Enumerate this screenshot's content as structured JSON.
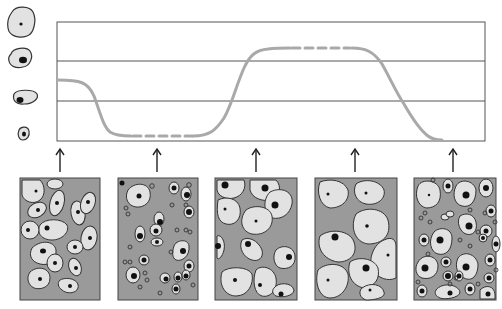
{
  "diagram": {
    "type": "cell-cycle-stage-graph",
    "colors": {
      "background": "#ffffff",
      "frame": "#555555",
      "curve": "#a9a9a9",
      "panel_bg": "#9a9a9a",
      "cell_fill": "#e2e2e2",
      "cell_outline": "#333333",
      "nucleus": "#111111"
    },
    "legend_cells": [
      {
        "id": "large-cell-small-nucleus",
        "size": "large"
      },
      {
        "id": "medium-cell-medium-nucleus",
        "size": "medium"
      },
      {
        "id": "small-oval-cell",
        "size": "small"
      },
      {
        "id": "tiny-cell-large-nucleus",
        "size": "tiny"
      }
    ],
    "graph": {
      "box": {
        "x": 57,
        "y": 22,
        "w": 428,
        "h": 119
      },
      "grid_lines_y": [
        61,
        101
      ],
      "curve_segments": [
        {
          "style": "solid",
          "description": "start mid level, fall to bottom"
        },
        {
          "style": "dashed",
          "description": "low plateau"
        },
        {
          "style": "solid",
          "description": "rise to top"
        },
        {
          "style": "dashed",
          "description": "high plateau"
        },
        {
          "style": "solid",
          "description": "fall to bottom"
        }
      ]
    },
    "arrows_x": [
      60,
      157,
      256,
      355,
      453
    ],
    "panels": [
      {
        "id": "panel-1",
        "label": "mixed elongated cells"
      },
      {
        "id": "panel-2",
        "label": "small cells with dense nuclei"
      },
      {
        "id": "panel-3",
        "label": "medium cells overlapping"
      },
      {
        "id": "panel-4",
        "label": "large flat cells"
      },
      {
        "id": "panel-5",
        "label": "mixed large and small cells"
      }
    ]
  }
}
